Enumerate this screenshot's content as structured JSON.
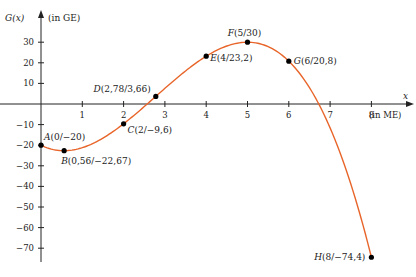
{
  "chart_data": {
    "type": "line",
    "title": "",
    "xlabel": "x (in ME)",
    "ylabel": "G(x) (in GE)",
    "x_axis_symbol": "x",
    "x_axis_unit": "(in ME)",
    "y_axis_symbol": "G(x)",
    "y_axis_unit": "(in GE)",
    "xlim": [
      0,
      8.5
    ],
    "ylim": [
      -76,
      38
    ],
    "x_ticks": [
      "1",
      "2",
      "3",
      "4",
      "5",
      "6",
      "7",
      "8"
    ],
    "y_ticks": [
      "30",
      "20",
      "10",
      "−10",
      "−20",
      "−30",
      "−40",
      "−50",
      "−60",
      "−70"
    ],
    "grid": false,
    "curve_color": "#e8652a",
    "points": [
      {
        "name": "A",
        "x": 0,
        "y": -20,
        "label": "A(0/−20)"
      },
      {
        "name": "B",
        "x": 0.56,
        "y": -22.67,
        "label": "B(0,56/−22,67)"
      },
      {
        "name": "C",
        "x": 2,
        "y": -9.6,
        "label": "C(2/−9,6)"
      },
      {
        "name": "D",
        "x": 2.78,
        "y": 3.66,
        "label": "D(2,78/3,66)"
      },
      {
        "name": "E",
        "x": 4,
        "y": 23.2,
        "label": "E(4/23,2)"
      },
      {
        "name": "F",
        "x": 5,
        "y": 30,
        "label": "F(5/30)"
      },
      {
        "name": "G",
        "x": 6,
        "y": 20.8,
        "label": "G(6/20,8)"
      },
      {
        "name": "H",
        "x": 8,
        "y": -74.4,
        "label": "H(8/−74,4)"
      }
    ]
  }
}
